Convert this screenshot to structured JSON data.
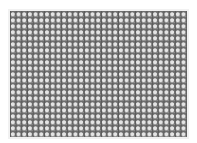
{
  "image": {
    "subject": "metal mesh screen texture",
    "background_color": "#ffffff",
    "mesh_color": "#6e6e6e",
    "cell_highlight_color": "#e4e4e4",
    "columns": 31,
    "rows": 21
  }
}
